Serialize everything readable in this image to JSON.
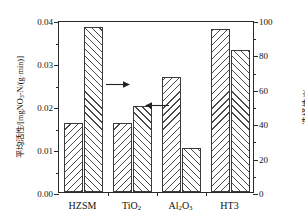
{
  "chart_data": {
    "type": "bar",
    "title": "",
    "subtitle": "",
    "categories": [
      "HZSM",
      "TiO₂",
      "Al₂O₃",
      "HT3"
    ],
    "series": [
      {
        "name": "平均活性",
        "axis": "left",
        "hatch": "backward-diagonal",
        "values": [
          0.016,
          0.016,
          0.0267,
          0.038
        ],
        "unit": "mgNO₃-N/(g·min)"
      },
      {
        "name": "选择性",
        "axis": "right",
        "hatch": "forward-diagonal",
        "values": [
          96,
          50,
          25.5,
          82.5
        ],
        "unit": "%"
      }
    ],
    "xlabel": "",
    "ylabel_left": "平均活性/[mgNO₃-N/(g·min)]",
    "ylabel_right": "选择性/%",
    "ylim_left": [
      0.0,
      0.04
    ],
    "ylim_right": [
      0,
      100
    ],
    "yticks_left": [
      "0.00",
      "0.01",
      "0.02",
      "0.03",
      "0.04"
    ],
    "yticks_left_values": [
      0.0,
      0.01,
      0.02,
      0.03,
      0.04
    ],
    "yticks_right": [
      "0",
      "20",
      "40",
      "60",
      "80",
      "100"
    ],
    "yticks_right_values": [
      0,
      20,
      40,
      60,
      80,
      100
    ],
    "grid": false,
    "legend": "none",
    "annotations": [
      {
        "name": "arrow-to-right-axis",
        "glyph": "→",
        "direction": "right",
        "points_to": "选择性/% (right axis)",
        "near_category": "HZSM"
      },
      {
        "name": "arrow-to-left-axis",
        "glyph": "←",
        "direction": "left",
        "points_to": "平均活性 (left axis)",
        "near_category": "Al₂O₃"
      }
    ],
    "colors": {
      "axis": "#2a2a2a",
      "bar_edge": "#3a3a3a",
      "hatch": "#4a4a4a",
      "background": "#ffffff",
      "text": "#111111"
    }
  },
  "axis_left_label_parts": {
    "prefix": "平均活性/[mgNO",
    "sub": "3",
    "suffix": "-N/(g·min)]"
  },
  "axis_right_label": "选择性/%"
}
